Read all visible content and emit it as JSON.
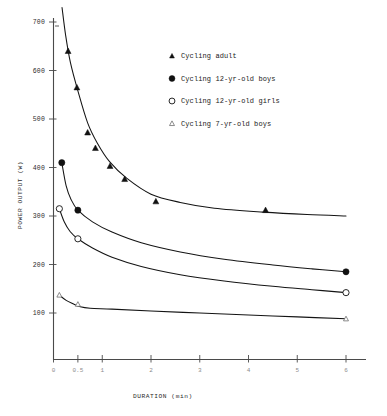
{
  "chart_data": {
    "type": "line",
    "title": "",
    "xlabel": "DURATION (min)",
    "ylabel": "POWER OUTPUT (W)",
    "xlim": [
      0,
      6.3
    ],
    "ylim": [
      0,
      730
    ],
    "xticks": [
      0,
      0.5,
      1,
      2,
      3,
      4,
      5,
      6
    ],
    "xtick_labels": [
      "0",
      "0.5",
      "1",
      "2",
      "3",
      "4",
      "5",
      "6"
    ],
    "yticks": [
      100,
      200,
      300,
      400,
      500,
      600,
      700
    ],
    "ytick_labels": [
      "100",
      "200",
      "300",
      "400",
      "500",
      "600",
      "700"
    ],
    "grid": false,
    "legend_position": "upper-right",
    "series": [
      {
        "name": "Cycling adult",
        "marker": "filled-triangle",
        "color": "#111111",
        "points": [
          {
            "x": 0.3,
            "y": 640
          },
          {
            "x": 0.48,
            "y": 565
          },
          {
            "x": 0.7,
            "y": 472
          },
          {
            "x": 0.86,
            "y": 440
          },
          {
            "x": 1.16,
            "y": 403
          },
          {
            "x": 1.46,
            "y": 376
          },
          {
            "x": 2.1,
            "y": 330
          },
          {
            "x": 4.35,
            "y": 312
          }
        ],
        "curve": [
          {
            "x": 0.175,
            "y": 730
          },
          {
            "x": 0.25,
            "y": 672
          },
          {
            "x": 0.35,
            "y": 615
          },
          {
            "x": 0.5,
            "y": 558
          },
          {
            "x": 0.7,
            "y": 492
          },
          {
            "x": 0.9,
            "y": 450
          },
          {
            "x": 1.15,
            "y": 412
          },
          {
            "x": 1.5,
            "y": 378
          },
          {
            "x": 2.0,
            "y": 345
          },
          {
            "x": 2.6,
            "y": 328
          },
          {
            "x": 3.3,
            "y": 316
          },
          {
            "x": 4.3,
            "y": 308
          },
          {
            "x": 5.2,
            "y": 303
          },
          {
            "x": 6.0,
            "y": 300
          }
        ]
      },
      {
        "name": "Cycling 12-yr-old boys",
        "marker": "filled-circle",
        "color": "#111111",
        "points": [
          {
            "x": 0.17,
            "y": 410
          },
          {
            "x": 0.5,
            "y": 312
          },
          {
            "x": 6.0,
            "y": 185
          }
        ],
        "curve": [
          {
            "x": 0.17,
            "y": 410
          },
          {
            "x": 0.26,
            "y": 362
          },
          {
            "x": 0.36,
            "y": 334
          },
          {
            "x": 0.5,
            "y": 312
          },
          {
            "x": 0.8,
            "y": 288
          },
          {
            "x": 1.2,
            "y": 267
          },
          {
            "x": 1.8,
            "y": 245
          },
          {
            "x": 2.6,
            "y": 226
          },
          {
            "x": 3.5,
            "y": 211
          },
          {
            "x": 4.5,
            "y": 199
          },
          {
            "x": 5.3,
            "y": 191
          },
          {
            "x": 6.0,
            "y": 185
          }
        ]
      },
      {
        "name": "Cycling 12-yr-old girls",
        "marker": "open-circle",
        "color": "#111111",
        "points": [
          {
            "x": 0.12,
            "y": 315
          },
          {
            "x": 0.5,
            "y": 253
          },
          {
            "x": 6.0,
            "y": 142
          }
        ],
        "curve": [
          {
            "x": 0.12,
            "y": 315
          },
          {
            "x": 0.22,
            "y": 288
          },
          {
            "x": 0.34,
            "y": 268
          },
          {
            "x": 0.5,
            "y": 253
          },
          {
            "x": 0.8,
            "y": 234
          },
          {
            "x": 1.2,
            "y": 215
          },
          {
            "x": 1.8,
            "y": 196
          },
          {
            "x": 2.6,
            "y": 179
          },
          {
            "x": 3.5,
            "y": 166
          },
          {
            "x": 4.5,
            "y": 155
          },
          {
            "x": 5.3,
            "y": 148
          },
          {
            "x": 6.0,
            "y": 142
          }
        ]
      },
      {
        "name": "Cycling 7-yr-old boys",
        "marker": "open-triangle",
        "color": "#6f6f6f",
        "points": [
          {
            "x": 0.12,
            "y": 137
          },
          {
            "x": 0.5,
            "y": 118
          },
          {
            "x": 6.0,
            "y": 88
          }
        ],
        "curve": [
          {
            "x": 0.12,
            "y": 137
          },
          {
            "x": 0.26,
            "y": 126
          },
          {
            "x": 0.4,
            "y": 119
          },
          {
            "x": 0.55,
            "y": 113
          },
          {
            "x": 0.75,
            "y": 110
          },
          {
            "x": 1.2,
            "y": 108
          },
          {
            "x": 2.0,
            "y": 104
          },
          {
            "x": 3.0,
            "y": 100
          },
          {
            "x": 4.0,
            "y": 96
          },
          {
            "x": 5.0,
            "y": 92
          },
          {
            "x": 6.0,
            "y": 88
          }
        ]
      }
    ]
  },
  "legend": {
    "entries": [
      {
        "label": "Cycling adult",
        "marker": "filled-triangle"
      },
      {
        "label": "Cycling 12-yr-old boys",
        "marker": "filled-circle"
      },
      {
        "label": "Cycling 12-yr-old girls",
        "marker": "open-circle"
      },
      {
        "label": "Cycling 7-yr-old boys",
        "marker": "open-triangle"
      }
    ]
  },
  "colors": {
    "axis": "#4a4a4a",
    "curve": "#141414",
    "text": "#1a1a1a",
    "xtick_text": "#8d8d8d",
    "background": "#ffffff"
  }
}
